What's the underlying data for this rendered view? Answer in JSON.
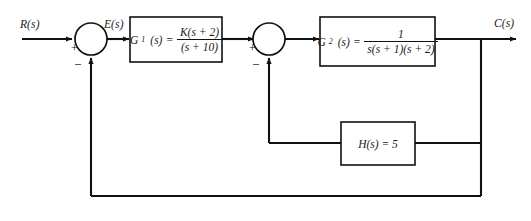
{
  "diagram": {
    "type": "control-system-block-diagram",
    "background_color": "#ffffff",
    "line_color": "#111111",
    "signals": {
      "input_label": "R(s)",
      "error_label": "E(s)",
      "output_label": "C(s)"
    },
    "summers": [
      {
        "id": "summer-1",
        "input_sign": "+",
        "feedback_sign": "–"
      },
      {
        "id": "summer-2",
        "input_sign": "+",
        "feedback_sign": "–"
      }
    ],
    "blocks": [
      {
        "id": "block-g1",
        "name": "G",
        "subscript": "1",
        "arg": "(s)",
        "equals": "=",
        "numerator": "K(s + 2)",
        "denominator": "(s + 10)",
        "expression": "G1(s) = K(s + 2)/(s + 10)"
      },
      {
        "id": "block-g2",
        "name": "G",
        "subscript": "2",
        "arg": "(s)",
        "equals": "=",
        "numerator": "1",
        "denominator": "s(s + 1)(s + 2)",
        "expression": "G2(s) = 1/[s(s + 1)(s + 2)]"
      },
      {
        "id": "block-h",
        "text": "H(s) = 5",
        "expression": "H(s) = 5"
      }
    ]
  }
}
